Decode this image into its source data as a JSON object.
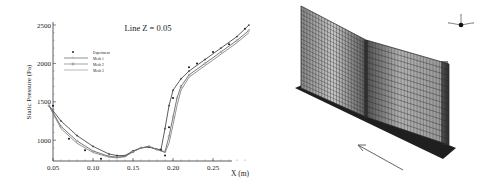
{
  "figure": {
    "left_panel": "Static pressure along line",
    "right_panel": "3D mesh of wall-mounted plate geometry with flow direction arrow"
  },
  "chart_data": {
    "type": "line",
    "title": "Line Z = 0.05",
    "xlabel": "X (m)",
    "ylabel": "Static Pressure (Pa)",
    "xlim": [
      0.045,
      0.3
    ],
    "ylim": [
      750,
      2550
    ],
    "x_ticks": [
      "0.05",
      "0.10",
      "0.15",
      "0.20",
      "0.25"
    ],
    "y_ticks": [
      "1000",
      "1500",
      "2000",
      "2500"
    ],
    "grid": false,
    "legend_position": "upper-left inside",
    "legend": [
      "Experiment",
      "Mesh 1",
      "Mesh 2",
      "Mesh 3"
    ],
    "series": [
      {
        "name": "Experiment",
        "marker": "filled-dot",
        "x": [
          0.05,
          0.07,
          0.09,
          0.11,
          0.13,
          0.15,
          0.17,
          0.185,
          0.19,
          0.195,
          0.2,
          0.21,
          0.22,
          0.23,
          0.25,
          0.27,
          0.29
        ],
        "y": [
          1450,
          1020,
          870,
          760,
          780,
          850,
          910,
          870,
          800,
          1170,
          1550,
          1700,
          1950,
          2000,
          2150,
          2250,
          2450
        ]
      },
      {
        "name": "Mesh 1",
        "marker": "plus",
        "x": [
          0.045,
          0.06,
          0.08,
          0.1,
          0.12,
          0.13,
          0.14,
          0.15,
          0.16,
          0.17,
          0.18,
          0.185,
          0.19,
          0.195,
          0.2,
          0.21,
          0.22,
          0.24,
          0.26,
          0.28,
          0.295
        ],
        "y": [
          1450,
          1250,
          1060,
          920,
          820,
          800,
          800,
          860,
          900,
          910,
          880,
          880,
          1150,
          1450,
          1650,
          1800,
          1900,
          2050,
          2200,
          2350,
          2500
        ]
      },
      {
        "name": "Mesh 2",
        "marker": "open-circle",
        "x": [
          0.045,
          0.06,
          0.08,
          0.1,
          0.12,
          0.13,
          0.14,
          0.15,
          0.16,
          0.17,
          0.18,
          0.19,
          0.195,
          0.2,
          0.205,
          0.21,
          0.22,
          0.24,
          0.26,
          0.28,
          0.295
        ],
        "y": [
          1450,
          1180,
          990,
          860,
          790,
          780,
          790,
          850,
          900,
          920,
          880,
          850,
          1050,
          1300,
          1550,
          1700,
          1850,
          2000,
          2150,
          2300,
          2430
        ]
      },
      {
        "name": "Mesh 3",
        "marker": "none",
        "x": [
          0.045,
          0.06,
          0.08,
          0.1,
          0.12,
          0.13,
          0.14,
          0.15,
          0.16,
          0.17,
          0.18,
          0.19,
          0.195,
          0.2,
          0.205,
          0.21,
          0.22,
          0.24,
          0.26,
          0.28,
          0.295
        ],
        "y": [
          1450,
          1150,
          960,
          840,
          780,
          770,
          785,
          850,
          900,
          915,
          880,
          840,
          960,
          1200,
          1450,
          1650,
          1820,
          1970,
          2120,
          2270,
          2400
        ]
      }
    ]
  },
  "mesh_view": {
    "axes_triad": [
      "x",
      "y",
      "z"
    ],
    "flow_arrow": "pointing up-left toward plate"
  }
}
